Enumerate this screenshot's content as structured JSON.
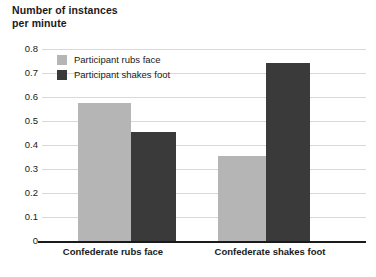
{
  "chart_data": {
    "type": "bar",
    "title": "Number of instances\nper minute",
    "xlabel": "",
    "ylabel": "Number of instances per minute",
    "ylim": [
      0,
      0.8
    ],
    "ytick_labels": [
      "0.8",
      "0.7",
      "0.6",
      "0.5",
      "0.4",
      "0.3",
      "0.2",
      "0.1",
      "0"
    ],
    "ytick_values": [
      0.8,
      0.7,
      0.6,
      0.5,
      0.4,
      0.3,
      0.2,
      0.1,
      0
    ],
    "grid": true,
    "legend_position": "upper-left-inside",
    "categories": [
      "Confederate rubs face",
      "Confederate shakes foot"
    ],
    "series": [
      {
        "name": "Participant rubs face",
        "color": "#b5b5b5",
        "values": [
          0.575,
          0.355
        ]
      },
      {
        "name": "Participant shakes foot",
        "color": "#3a3a3a",
        "values": [
          0.455,
          0.74
        ]
      }
    ]
  },
  "colors": {
    "light_series": "#b5b5b5",
    "dark_series": "#3a3a3a",
    "gridline": "#d9d9d9",
    "axis": "#1a1a1a",
    "background": "#ffffff"
  }
}
